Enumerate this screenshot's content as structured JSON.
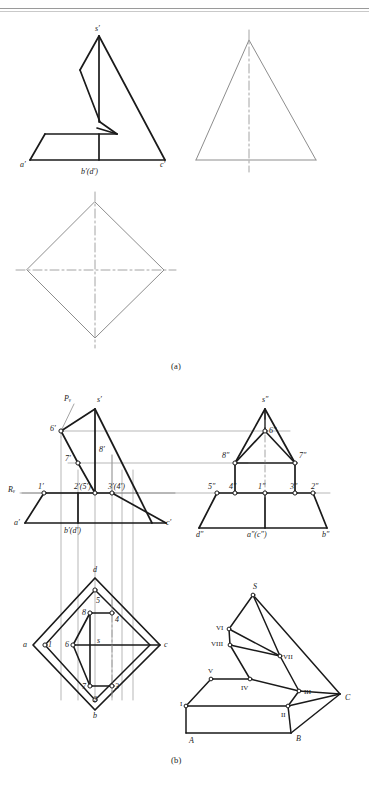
{
  "document": {
    "title": "Orthographic projection exercise - pyramid with cut",
    "captions": {
      "a": "(a)",
      "b": "(b)"
    },
    "header_rule": true
  },
  "colors": {
    "outline": "#1a1a1a",
    "thin": "#8d8d8d",
    "centerline": "#9a9a9a",
    "projection": "#9a9a9a",
    "background": "#ffffff",
    "vertex_fill": "#ffffff"
  },
  "figure_a": {
    "name": "figure-a",
    "front_view": {
      "name": "front-view-a",
      "labels": [
        {
          "id": "s-prime",
          "text": "s′",
          "x": 95,
          "y": 29
        },
        {
          "id": "a-prime",
          "text": "a′",
          "x": 22,
          "y": 163
        },
        {
          "id": "b-d-prime",
          "text": "b′(d′)",
          "x": 81,
          "y": 170
        },
        {
          "id": "c-prime",
          "text": "c′",
          "x": 161,
          "y": 163
        }
      ]
    },
    "side_view": {
      "name": "side-view-a",
      "labels": []
    },
    "top_view": {
      "name": "top-view-a",
      "labels": []
    }
  },
  "figure_b": {
    "name": "figure-b",
    "front_view": {
      "name": "front-view-b",
      "labels": [
        {
          "id": "pv-plane",
          "text": "Pᵥ",
          "x": 64,
          "y": 396
        },
        {
          "id": "s-prime",
          "text": "s′",
          "x": 100,
          "y": 396
        },
        {
          "id": "point-6-prime",
          "text": "6′",
          "x": 52,
          "y": 424
        },
        {
          "id": "point-7-prime",
          "text": "7′",
          "x": 60,
          "y": 456
        },
        {
          "id": "point-8-prime",
          "text": "8′",
          "x": 93,
          "y": 440
        },
        {
          "id": "rv-axis",
          "text": "Rᵥ",
          "x": 10,
          "y": 487
        },
        {
          "id": "point-1-prime",
          "text": "1′",
          "x": 37,
          "y": 486
        },
        {
          "id": "point-2-5-prime",
          "text": "2′(5′)",
          "x": 68,
          "y": 486
        },
        {
          "id": "point-3-4-prime",
          "text": "3′(4′)",
          "x": 104,
          "y": 486
        },
        {
          "id": "a-prime",
          "text": "a′",
          "x": 13,
          "y": 514
        },
        {
          "id": "b-d-prime",
          "text": "b′(d′)",
          "x": 76,
          "y": 520
        },
        {
          "id": "c-prime",
          "text": "c′",
          "x": 154,
          "y": 514
        }
      ]
    },
    "side_view": {
      "name": "side-view-b",
      "labels": [
        {
          "id": "s-dprime",
          "text": "s″",
          "x": 278,
          "y": 396
        },
        {
          "id": "point-6-dprime",
          "text": "6″",
          "x": 285,
          "y": 429
        },
        {
          "id": "point-8-dprime",
          "text": "8″",
          "x": 243,
          "y": 452
        },
        {
          "id": "point-7-dprime",
          "text": "7″",
          "x": 313,
          "y": 452
        },
        {
          "id": "point-5-dprime",
          "text": "5″",
          "x": 209,
          "y": 486
        },
        {
          "id": "point-4-dprime",
          "text": "4″",
          "x": 232,
          "y": 486
        },
        {
          "id": "point-1-dprime",
          "text": "1″",
          "x": 264,
          "y": 486
        },
        {
          "id": "point-3-dprime",
          "text": "3″",
          "x": 293,
          "y": 486
        },
        {
          "id": "point-2-dprime",
          "text": "2″",
          "x": 314,
          "y": 486
        },
        {
          "id": "d-dprime",
          "text": "d″",
          "x": 203,
          "y": 517
        },
        {
          "id": "a-c-dprime",
          "text": "a″(c″)",
          "x": 249,
          "y": 517
        },
        {
          "id": "b-dprime",
          "text": "b″",
          "x": 318,
          "y": 517
        }
      ]
    },
    "top_view": {
      "name": "top-view-b",
      "labels": [
        {
          "id": "point-d",
          "text": "d",
          "x": 95,
          "y": 568
        },
        {
          "id": "point-a",
          "text": "a",
          "x": 21,
          "y": 641
        },
        {
          "id": "point-c",
          "text": "c",
          "x": 166,
          "y": 641
        },
        {
          "id": "point-b",
          "text": "b",
          "x": 96,
          "y": 714
        },
        {
          "id": "point-s",
          "text": "s",
          "x": 96,
          "y": 638
        },
        {
          "id": "point-1",
          "text": "1",
          "x": 44,
          "y": 644
        },
        {
          "id": "point-2",
          "text": "2",
          "x": 95,
          "y": 699
        },
        {
          "id": "point-3",
          "text": "3",
          "x": 113,
          "y": 686
        },
        {
          "id": "point-4",
          "text": "4",
          "x": 113,
          "y": 617
        },
        {
          "id": "point-5",
          "text": "5",
          "x": 97,
          "y": 598
        },
        {
          "id": "point-6",
          "text": "6",
          "x": 73,
          "y": 644
        },
        {
          "id": "point-7",
          "text": "7",
          "x": 88,
          "y": 686
        },
        {
          "id": "point-8",
          "text": "8",
          "x": 90,
          "y": 613
        }
      ]
    },
    "pictorial_view": {
      "name": "pictorial-view-b",
      "labels": [
        {
          "id": "apex-S",
          "text": "S",
          "x": 254,
          "y": 585
        },
        {
          "id": "vertex-VI",
          "text": "VI",
          "x": 224,
          "y": 622
        },
        {
          "id": "vertex-VIII",
          "text": "VIII",
          "x": 219,
          "y": 638
        },
        {
          "id": "vertex-VII",
          "text": "VII",
          "x": 277,
          "y": 655
        },
        {
          "id": "vertex-V",
          "text": "V",
          "x": 214,
          "y": 671
        },
        {
          "id": "vertex-IV",
          "text": "IV",
          "x": 243,
          "y": 692
        },
        {
          "id": "vertex-III",
          "text": "III",
          "x": 307,
          "y": 693
        },
        {
          "id": "vertex-C",
          "text": "C",
          "x": 336,
          "y": 700
        },
        {
          "id": "vertex-I",
          "text": "I",
          "x": 187,
          "y": 702
        },
        {
          "id": "vertex-II",
          "text": "II",
          "x": 281,
          "y": 709
        },
        {
          "id": "vertex-A",
          "text": "A",
          "x": 192,
          "y": 739
        },
        {
          "id": "vertex-B",
          "text": "B",
          "x": 297,
          "y": 737
        }
      ]
    }
  },
  "geometry_notes": {
    "description": "Descriptive-geometry exercise: square pyramid truncated by an inclined plane; views a) front/side/top outlines, b) fully annotated three-view plus pictorial."
  }
}
